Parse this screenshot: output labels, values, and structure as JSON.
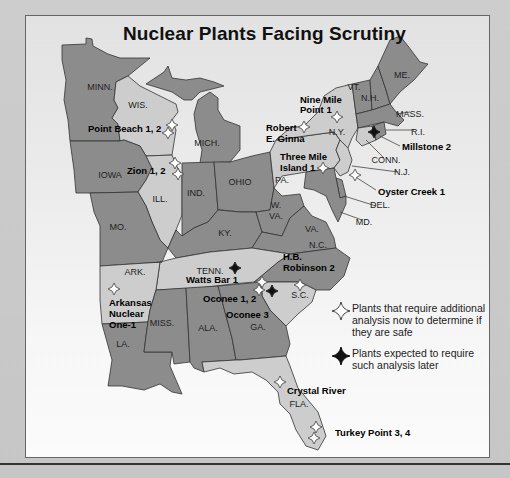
{
  "title": "Nuclear Plants Facing Scrutiny",
  "colors": {
    "dark_state": "#8c8c8c",
    "light_state": "#cdcdcd",
    "border": "#333333",
    "marker_open_fill": "#ffffff",
    "marker_filled": "#111111"
  },
  "states": [
    {
      "abbr": "MINN.",
      "shade": "dark",
      "label_xy": [
        100,
        90
      ],
      "path": "M62,45 L86,44 L86,38 L92,39 L93,46 L108,54 L120,58 L150,58 L128,76 L116,82 L114,100 L118,108 L112,118 L118,124 L120,141 L70,141 L68,120 L64,100 L66,80 L62,60 Z"
    },
    {
      "abbr": "WIS.",
      "shade": "light",
      "label_xy": [
        138,
        108
      ],
      "path": "M116,82 L128,76 L140,86 L160,96 L176,104 L178,112 L172,120 L176,130 L172,155 L146,156 L140,146 L124,140 L120,141 L118,124 L112,118 L118,108 L114,100 Z"
    },
    {
      "abbr": "MICH.",
      "shade": "dark",
      "label_xy": [
        207,
        146
      ],
      "path": "M146,84 L164,72 L168,66 L172,78 L186,80 L200,78 L214,82 L224,86 L200,92 L192,100 L184,100 L172,92 Z M198,100 L210,92 L218,98 L218,110 L224,120 L240,126 L240,150 L230,162 L200,163 L202,150 L196,130 L194,114 Z"
    },
    {
      "abbr": "IOWA",
      "shade": "dark",
      "label_xy": [
        110,
        178
      ],
      "path": "M70,141 L120,141 L124,140 L140,146 L146,156 L152,168 L146,180 L138,192 L90,193 L76,193 L74,170 Z"
    },
    {
      "abbr": "ILL.",
      "shade": "light",
      "label_xy": [
        160,
        202
      ],
      "path": "M146,156 L172,155 L176,165 L182,175 L182,215 L176,230 L168,248 L160,240 L152,222 L146,206 L138,192 L146,180 L152,168 Z"
    },
    {
      "abbr": "IND.",
      "shade": "dark",
      "label_xy": [
        196,
        196
      ],
      "path": "M182,163 L214,162 L218,210 L208,222 L194,228 L182,236 L182,215 Z"
    },
    {
      "abbr": "OHIO",
      "shade": "dark",
      "label_xy": [
        240,
        185
      ],
      "path": "M214,162 L230,162 L252,156 L270,152 L274,188 L270,210 L256,212 L240,212 L222,210 L218,210 Z"
    },
    {
      "abbr": "MO.",
      "shade": "dark",
      "label_xy": [
        118,
        230
      ],
      "path": "M90,193 L138,192 L146,206 L152,222 L160,240 L168,248 L162,262 L100,266 L100,226 L94,212 Z"
    },
    {
      "abbr": "KY.",
      "shade": "dark",
      "label_xy": [
        225,
        236
      ],
      "path": "M168,248 L176,230 L182,236 L194,228 L208,222 L218,210 L240,212 L256,212 L262,232 L252,248 L210,252 L176,258 Z"
    },
    {
      "abbr": "W. VA.",
      "shade": "dark",
      "label_xy": [
        276,
        213
      ],
      "path": "M270,210 L274,188 L282,196 L300,194 L304,206 L290,218 L282,236 L262,232 L256,212 Z"
    },
    {
      "abbr": "VA.",
      "shade": "dark",
      "label_xy": [
        312,
        232
      ],
      "path": "M252,248 L262,232 L282,236 L290,218 L304,206 L312,216 L326,222 L334,238 L336,248 L290,254 Z"
    },
    {
      "abbr": "PA.",
      "shade": "light",
      "label_xy": [
        282,
        183
      ],
      "path": "M270,152 L276,140 L334,132 L340,140 L336,150 L340,160 L334,168 L306,172 L282,176 L274,188 Z"
    },
    {
      "abbr": "N.Y.",
      "shade": "light",
      "label_xy": [
        337,
        135
      ],
      "path": "M276,140 L290,128 L304,126 L318,112 L324,96 L336,88 L352,84 L356,114 L358,128 L352,138 L348,148 L340,140 L334,132 Z"
    },
    {
      "abbr": "N.J.",
      "shade": "light",
      "label_xy": [
        402,
        175
      ],
      "path": "M340,140 L348,148 L352,160 L348,172 L340,176 L334,168 L340,160 L336,150 Z"
    },
    {
      "abbr": "DEL.",
      "shade": "dark",
      "label_xy": [
        380,
        208
      ],
      "path": "M336,178 L342,180 L346,196 L340,198 Z"
    },
    {
      "abbr": "MD.",
      "shade": "dark",
      "label_xy": [
        364,
        225
      ],
      "path": "M306,172 L334,168 L340,198 L346,196 L346,204 L338,222 L332,210 L326,196 L314,190 L304,188 Z"
    },
    {
      "abbr": "VT.",
      "shade": "dark",
      "label_xy": [
        354,
        90
      ],
      "path": "M352,84 L370,80 L372,110 L356,114 Z"
    },
    {
      "abbr": "N.H.",
      "shade": "dark",
      "label_xy": [
        370,
        101
      ],
      "path": "M370,80 L378,66 L386,90 L390,104 L372,110 Z"
    },
    {
      "abbr": "ME.",
      "shade": "dark",
      "label_xy": [
        402,
        78
      ],
      "path": "M378,66 L390,40 L400,36 L408,46 L420,62 L428,64 L414,80 L400,92 L390,104 L386,90 Z"
    },
    {
      "abbr": "MASS.",
      "shade": "dark",
      "label_xy": [
        410,
        117
      ],
      "path": "M356,114 L372,110 L390,104 L396,112 L404,120 L398,126 L384,122 L358,128 Z"
    },
    {
      "abbr": "CONN.",
      "shade": "light",
      "label_xy": [
        386,
        163
      ],
      "path": "M358,128 L372,126 L376,140 L362,146 L356,140 Z"
    },
    {
      "abbr": "R.I.",
      "shade": "dark",
      "label_xy": [
        418,
        135
      ],
      "path": "M372,126 L384,122 L386,134 L376,140 Z"
    },
    {
      "abbr": "N.C.",
      "shade": "dark",
      "label_xy": [
        318,
        248
      ],
      "path": "M254,282 L278,262 L290,254 L336,248 L350,258 L344,276 L330,290 L316,290 L300,282 L280,282 Z"
    },
    {
      "abbr": "TENN.",
      "shade": "light",
      "label_xy": [
        210,
        274
      ],
      "path": "M160,262 L176,258 L210,252 L252,248 L290,254 L278,262 L254,282 L232,284 L200,288 L156,290 Z"
    },
    {
      "abbr": "S.C.",
      "shade": "light",
      "label_xy": [
        300,
        298
      ],
      "path": "M262,282 L280,282 L300,282 L316,290 L312,302 L298,314 L286,326 L270,310 L262,296 Z"
    },
    {
      "abbr": "ARK.",
      "shade": "light",
      "label_xy": [
        135,
        275
      ],
      "path": "M100,266 L162,262 L160,262 L156,290 L150,310 L148,322 L102,324 L100,300 Z"
    },
    {
      "abbr": "LA.",
      "shade": "dark",
      "label_xy": [
        123,
        347
      ],
      "path": "M102,324 L148,322 L146,336 L144,352 L172,352 L170,366 L182,394 L172,392 L160,384 L144,390 L122,386 L108,386 L112,360 Z"
    },
    {
      "abbr": "MISS.",
      "shade": "dark",
      "label_xy": [
        162,
        326
      ],
      "path": "M156,290 L186,288 L190,362 L174,364 L172,352 L144,352 L146,336 L148,322 L150,310 Z"
    },
    {
      "abbr": "ALA.",
      "shade": "dark",
      "label_xy": [
        208,
        331
      ],
      "path": "M186,288 L218,286 L232,338 L236,360 L202,362 L204,372 L194,368 L190,362 Z"
    },
    {
      "abbr": "GA.",
      "shade": "dark",
      "label_xy": [
        258,
        330
      ],
      "path": "M218,286 L262,282 L262,296 L270,310 L286,326 L290,344 L286,356 L240,360 L236,360 L232,338 Z"
    },
    {
      "abbr": "FLA.",
      "shade": "light",
      "label_xy": [
        299,
        407
      ],
      "path": "M202,362 L236,360 L240,360 L286,356 L290,366 L298,388 L318,412 L326,436 L318,450 L306,446 L296,430 L290,414 L280,404 L278,392 L266,380 L252,372 L234,374 L220,368 L204,372 Z"
    }
  ],
  "plants": [
    {
      "name": "Point Beach 1, 2",
      "type": "open",
      "markers": [
        [
          172,
          125
        ],
        [
          168,
          133
        ]
      ],
      "label_xy": [
        88,
        132
      ],
      "anchor": "start"
    },
    {
      "name": "Zion 1, 2",
      "type": "open",
      "markers": [
        [
          175,
          163
        ],
        [
          178,
          174
        ]
      ],
      "label_xy": [
        127,
        174
      ],
      "anchor": "start"
    },
    {
      "name": "Nine Mile",
      "type": "open",
      "markers": [
        [
          337,
          117
        ]
      ],
      "label_xy": [
        300,
        103
      ],
      "anchor": "start"
    },
    {
      "name": "Point 1",
      "type": "none",
      "markers": [],
      "label_xy": [
        300,
        113
      ],
      "anchor": "start"
    },
    {
      "name": "Robert",
      "type": "open",
      "markers": [
        [
          304,
          127
        ]
      ],
      "label_xy": [
        266,
        131
      ],
      "anchor": "start"
    },
    {
      "name": "E. Ginna",
      "type": "none",
      "markers": [],
      "label_xy": [
        266,
        142
      ],
      "anchor": "start"
    },
    {
      "name": "Three Mile",
      "type": "open",
      "markers": [
        [
          323,
          168
        ]
      ],
      "label_xy": [
        280,
        160
      ],
      "anchor": "start"
    },
    {
      "name": "Island 1",
      "type": "none",
      "markers": [],
      "label_xy": [
        280,
        171
      ],
      "anchor": "start"
    },
    {
      "name": "Millstone 2",
      "type": "filled",
      "markers": [
        [
          374,
          132
        ]
      ],
      "label_xy": [
        402,
        150
      ],
      "anchor": "start"
    },
    {
      "name": "Oyster Creek 1",
      "type": "open",
      "markers": [
        [
          355,
          175
        ]
      ],
      "label_xy": [
        378,
        195
      ],
      "anchor": "start"
    },
    {
      "name": "H.B.",
      "type": "open",
      "markers": [
        [
          300,
          285
        ]
      ],
      "label_xy": [
        283,
        260
      ],
      "anchor": "start"
    },
    {
      "name": "Robinson 2",
      "type": "none",
      "markers": [],
      "label_xy": [
        283,
        271
      ],
      "anchor": "start"
    },
    {
      "name": "Watts Bar 1",
      "type": "filled",
      "markers": [
        [
          235,
          268
        ]
      ],
      "label_xy": [
        186,
        283
      ],
      "anchor": "start"
    },
    {
      "name": "Oconee 1, 2",
      "type": "open",
      "markers": [
        [
          262,
          282
        ],
        [
          259,
          290
        ]
      ],
      "label_xy": [
        203,
        302
      ],
      "anchor": "start"
    },
    {
      "name": "Oconee 3",
      "type": "filled",
      "markers": [
        [
          272,
          291
        ]
      ],
      "label_xy": [
        226,
        318
      ],
      "anchor": "start"
    },
    {
      "name": "Arkansas",
      "type": "open",
      "markers": [
        [
          114,
          289
        ]
      ],
      "label_xy": [
        109,
        306
      ],
      "anchor": "start"
    },
    {
      "name": "Nuclear",
      "type": "none",
      "markers": [],
      "label_xy": [
        109,
        317
      ],
      "anchor": "start"
    },
    {
      "name": "One-1",
      "type": "none",
      "markers": [],
      "label_xy": [
        109,
        328
      ],
      "anchor": "start"
    },
    {
      "name": "Crystal River",
      "type": "open",
      "markers": [
        [
          280,
          382
        ]
      ],
      "label_xy": [
        287,
        394
      ],
      "anchor": "start"
    },
    {
      "name": "Turkey Point 3, 4",
      "type": "open",
      "markers": [
        [
          316,
          427
        ],
        [
          314,
          438
        ]
      ],
      "label_xy": [
        335,
        436
      ],
      "anchor": "start"
    }
  ],
  "callouts": [
    {
      "from": [
        396,
        114
      ],
      "to": [
        410,
        112
      ]
    },
    {
      "from": [
        386,
        130
      ],
      "to": [
        414,
        130
      ]
    },
    {
      "from": [
        380,
        136
      ],
      "to": [
        400,
        146
      ]
    },
    {
      "from": [
        366,
        140
      ],
      "to": [
        384,
        158
      ]
    },
    {
      "from": [
        352,
        166
      ],
      "to": [
        398,
        172
      ]
    },
    {
      "from": [
        354,
        176
      ],
      "to": [
        376,
        190
      ]
    },
    {
      "from": [
        344,
        196
      ],
      "to": [
        376,
        206
      ]
    },
    {
      "from": [
        340,
        212
      ],
      "to": [
        362,
        220
      ]
    }
  ],
  "legend": {
    "items": [
      {
        "icon": "open-diamond",
        "text": "Plants that require additional analysis now to determine if they are safe"
      },
      {
        "icon": "filled-diamond",
        "text": "Plants expected to require such analysis later"
      }
    ]
  }
}
